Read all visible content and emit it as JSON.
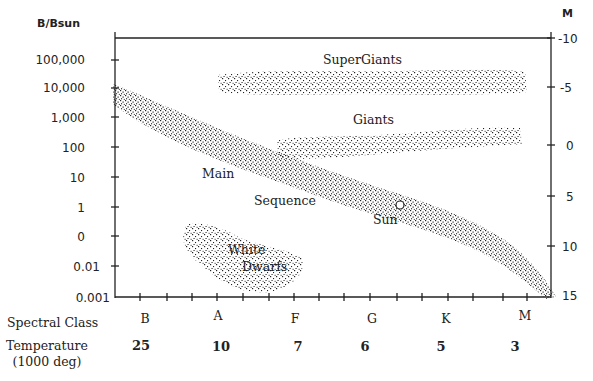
{
  "diagram": {
    "type": "Hertzsprung-Russell diagram",
    "left_axis": {
      "title": "B/Bsun",
      "ticks": [
        "100,000",
        "10,000",
        "1,000",
        "100",
        "10",
        "1",
        "0",
        "0.01",
        "0.001"
      ]
    },
    "right_axis": {
      "title": "M",
      "ticks": [
        "-10",
        "-5",
        "0",
        "5",
        "10",
        "15"
      ]
    },
    "bottom_rows": {
      "spectral_class_label": "Spectral Class",
      "spectral_classes": [
        "B",
        "A",
        "F",
        "G",
        "K",
        "M"
      ],
      "temperature_label_line1": "Temperature",
      "temperature_label_line2": "(1000 deg)",
      "temperatures": [
        "25",
        "10",
        "7",
        "6",
        "5",
        "3"
      ]
    },
    "regions": {
      "supergiants": "SuperGiants",
      "giants": "Giants",
      "main_line1": "Main",
      "main_line2": "Sequence",
      "sun": "Sun",
      "white_dwarfs_line1": "White",
      "white_dwarfs_line2": "Dwarfs"
    },
    "colors": {
      "ink": "#222222",
      "background": "#ffffff"
    }
  }
}
